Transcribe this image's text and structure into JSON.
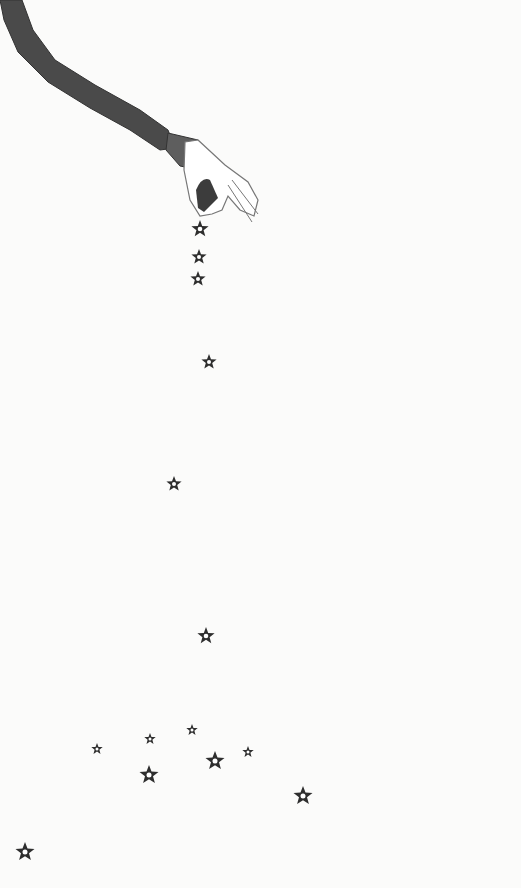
{
  "illustration": {
    "subject": "hand dropping stars",
    "colors": {
      "background": "#fbfbfa",
      "sleeve": "#4a4a4a",
      "cuff": "#5e5e5e",
      "hand_outline": "#777777",
      "glove": "#ffffff",
      "held_object": "#3c3c3c",
      "star": "#2e2e2e"
    },
    "star_count": 15
  }
}
